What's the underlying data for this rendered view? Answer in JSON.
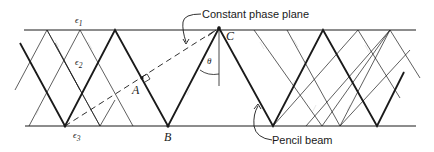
{
  "labels": {
    "epsilon_1": "ϵ",
    "epsilon_1_sub": "1",
    "epsilon_2": "ϵ",
    "epsilon_2_sub": "2",
    "epsilon_3": "ϵ",
    "epsilon_3_sub": "3",
    "point_a": "A",
    "point_b": "B",
    "point_c": "C",
    "angle_theta": "θ",
    "constant_phase_plane": "Constant phase plane",
    "pencil_beam": "Pencil beam"
  },
  "colors": {
    "line": "#1a1a1a",
    "background": "#ffffff"
  }
}
